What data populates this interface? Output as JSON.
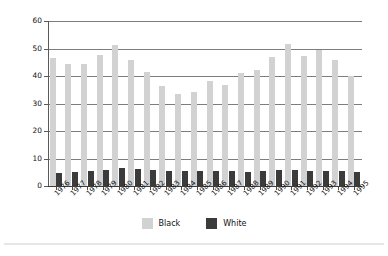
{
  "chart_data": {
    "type": "bar",
    "title": "",
    "subtitle": "",
    "xlabel": "",
    "ylabel": "Rate per 100,000",
    "ylim": [
      0,
      60
    ],
    "yticks": [
      0,
      10,
      20,
      30,
      40,
      50,
      60
    ],
    "grid": true,
    "legend_position": "bottom-center",
    "categories": [
      "1976",
      "1977",
      "1978",
      "1979",
      "1980",
      "1981",
      "1982",
      "1983",
      "1984",
      "1985",
      "1986",
      "1987",
      "1988",
      "1989",
      "1990",
      "1991",
      "1992",
      "1993",
      "1994",
      "1995"
    ],
    "series": [
      {
        "name": "Black",
        "color": "#d2d2d2",
        "values": [
          46.5,
          44.3,
          44.5,
          47.8,
          51.2,
          46.0,
          41.3,
          36.4,
          33.4,
          34.1,
          38.2,
          36.8,
          41.2,
          42.2,
          46.8,
          51.5,
          47.4,
          49.5,
          45.7,
          40.0
        ]
      },
      {
        "name": "White",
        "color": "#3b3b3b",
        "values": [
          4.9,
          5.0,
          5.3,
          5.8,
          6.5,
          6.1,
          5.7,
          5.4,
          5.4,
          5.3,
          5.4,
          5.3,
          5.2,
          5.3,
          5.9,
          5.9,
          5.4,
          5.4,
          5.3,
          5.1
        ]
      }
    ]
  },
  "legend": {
    "items": [
      {
        "label": "Black",
        "color": "#d2d2d2"
      },
      {
        "label": "White",
        "color": "#3b3b3b"
      }
    ]
  }
}
